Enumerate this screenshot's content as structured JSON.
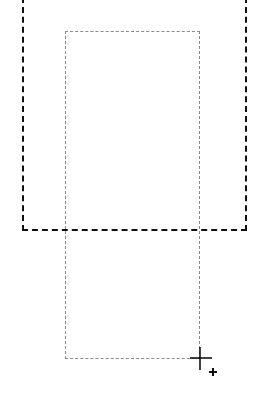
{
  "canvas": {
    "background": "#ffffff",
    "outer_selection": {
      "color": "#111111",
      "style": "dashed"
    },
    "inner_selection": {
      "color": "#8a8a8a",
      "style": "dashed"
    },
    "cursor": {
      "icon": "crosshair-add-icon"
    }
  }
}
